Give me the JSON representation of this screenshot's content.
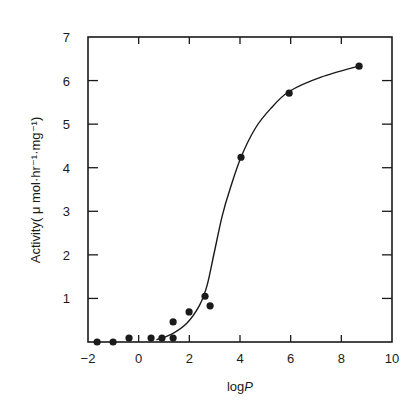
{
  "chart_data": {
    "type": "scatter",
    "title": "",
    "xlabel": "logP",
    "ylabel": "Activity( μ mol·hr⁻¹·mg⁻¹)",
    "xlim": [
      -2,
      10
    ],
    "ylim": [
      0,
      7
    ],
    "x_ticks": [
      -2,
      0,
      2,
      4,
      6,
      8,
      10
    ],
    "y_ticks": [
      1,
      2,
      3,
      4,
      5,
      6,
      7
    ],
    "grid": false,
    "legend": null,
    "series": [
      {
        "name": "measured",
        "kind": "points",
        "marker": "filled-circle",
        "x": [
          -1.64,
          -1.01,
          -0.38,
          0.49,
          0.92,
          1.36,
          1.36,
          1.99,
          2.62,
          2.82,
          4.04,
          5.94,
          8.7
        ],
        "y": [
          0.0,
          0.0,
          0.09,
          0.09,
          0.09,
          0.09,
          0.46,
          0.69,
          1.05,
          0.83,
          4.24,
          5.71,
          6.33
        ]
      },
      {
        "name": "fitted sigmoid",
        "kind": "line",
        "x": [
          0.7,
          1.3,
          1.9,
          2.4,
          2.7,
          3.0,
          3.3,
          3.6,
          4.04,
          4.6,
          5.2,
          5.94,
          7.2,
          8.8
        ],
        "y": [
          0.05,
          0.18,
          0.43,
          0.84,
          1.3,
          2.1,
          2.9,
          3.5,
          4.24,
          4.9,
          5.35,
          5.75,
          6.08,
          6.35
        ]
      }
    ]
  },
  "axes": {
    "x_title": "logP",
    "x_title_main": "log",
    "x_title_italic": "P",
    "y_title": "Activity( μ mol·hr⁻¹·mg⁻¹)"
  },
  "colors": {
    "ink": "#1a1a1a",
    "background": "#ffffff"
  }
}
